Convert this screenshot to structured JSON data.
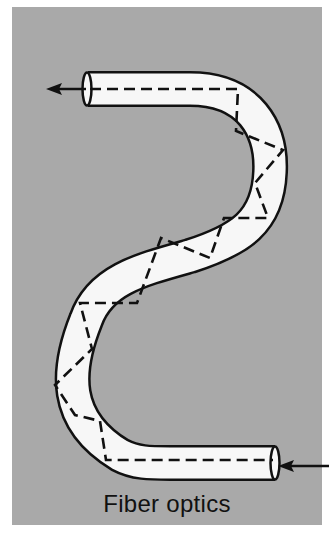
{
  "figure": {
    "caption": "Fiber optics",
    "colors": {
      "background_panel": "#a9a9a9",
      "fiber_fill": "#f7f7f7",
      "line": "#111111",
      "page": "#ffffff"
    },
    "elements": {
      "input_arrow": {
        "direction": "left",
        "label": "light-in"
      },
      "output_arrow": {
        "direction": "left",
        "label": "light-out"
      },
      "light_path": {
        "style": "dashed",
        "description": "zig-zag total internal reflection path"
      }
    }
  }
}
